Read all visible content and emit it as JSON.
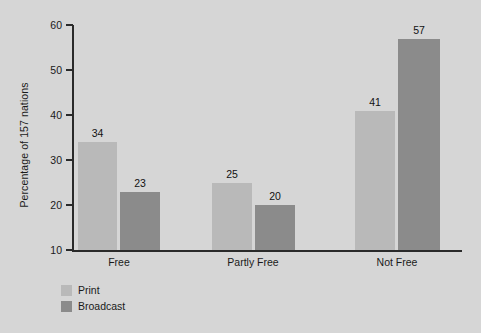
{
  "chart_data": {
    "type": "bar",
    "title": "",
    "xlabel": "",
    "ylabel": "Percentage of 157 nations",
    "categories": [
      "Free",
      "Partly Free",
      "Not Free"
    ],
    "series": [
      {
        "name": "Print",
        "values": [
          34,
          25,
          41
        ],
        "color": "#b9b9b9"
      },
      {
        "name": "Broadcast",
        "values": [
          23,
          20,
          57
        ],
        "color": "#8b8b8b"
      }
    ],
    "ylim": [
      10,
      60
    ],
    "yticks": [
      60,
      50,
      40,
      30,
      20,
      10
    ],
    "ytick_labels": [
      "60",
      "50",
      "40",
      "30",
      "20",
      "10"
    ],
    "grid": false,
    "legend_position": "bottom-left",
    "background_color": "#d6d6d6",
    "axis_color": "#2a2a2a"
  },
  "legend": {
    "entries": [
      {
        "label": "Print",
        "color": "#b9b9b9"
      },
      {
        "label": "Broadcast",
        "color": "#8b8b8b"
      }
    ]
  }
}
